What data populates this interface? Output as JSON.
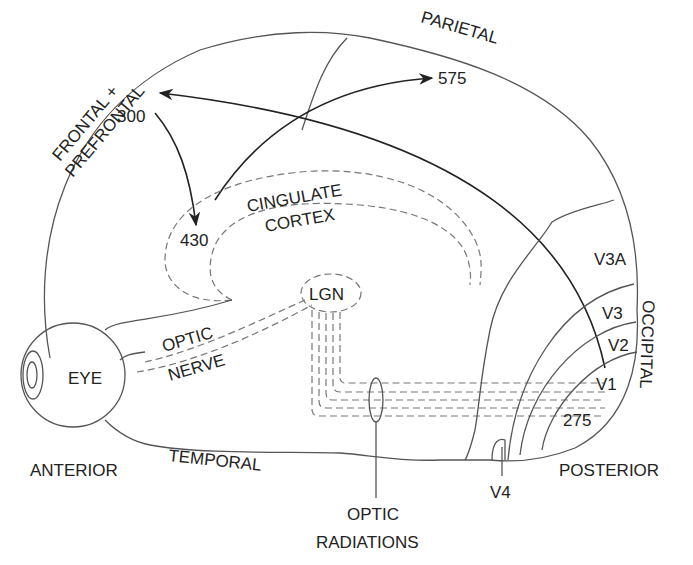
{
  "diagram": {
    "regions": {
      "frontal_line1": "FRONTAL +",
      "frontal_line2": "PREFRONTAL",
      "parietal": "PARIETAL",
      "occipital": "OCCIPITAL",
      "temporal": "TEMPORAL",
      "cingulate_line1": "CINGULATE",
      "cingulate_line2": "CORTEX"
    },
    "structures": {
      "eye": "EYE",
      "lgn": "LGN",
      "optic_nerve_line1": "OPTIC",
      "optic_nerve_line2": "NERVE",
      "optic_radiations_line1": "OPTIC",
      "optic_radiations_line2": "RADIATIONS"
    },
    "visual_areas": {
      "v1": "V1",
      "v2": "V2",
      "v3": "V3",
      "v3a": "V3A",
      "v4": "V4"
    },
    "orientation": {
      "anterior": "ANTERIOR",
      "posterior": "POSTERIOR"
    },
    "latencies": {
      "v1": "275",
      "frontal": "300",
      "cingulate": "430",
      "parietal": "575"
    },
    "colors": {
      "line": "#555555",
      "arrow": "#222222",
      "dashed": "#777777",
      "background": "#ffffff"
    }
  }
}
